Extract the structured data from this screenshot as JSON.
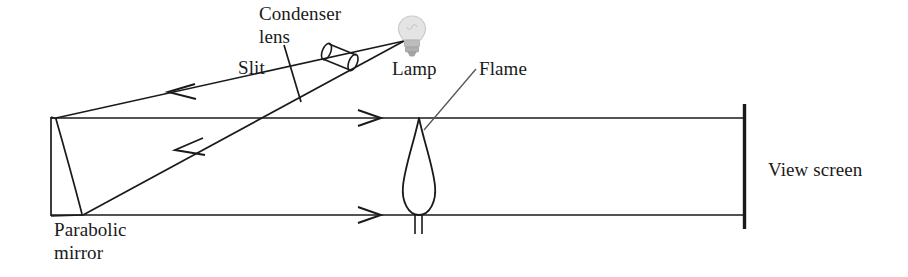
{
  "figure": {
    "type": "optics-ray-diagram",
    "background_color": "#ffffff",
    "ink_color": "#1a1a1a",
    "width": 908,
    "height": 277
  },
  "labels": {
    "condenser_lens_line1": "Condenser",
    "condenser_lens_line2": "lens",
    "slit": "Slit",
    "lamp": "Lamp",
    "flame": "Flame",
    "view_screen": "View screen",
    "parabolic_mirror_line1": "Parabolic",
    "parabolic_mirror_line2": "mirror"
  },
  "components": {
    "lamp": {
      "name": "lamp-bulb",
      "shape": "incandescent-bulb",
      "center_x": 412,
      "center_y": 34,
      "glass_color": "#e2e2e2",
      "base_color": "#b4b4b4"
    },
    "condenser_lens": {
      "name": "condenser-lens",
      "shape": "cylinder-in-perspective",
      "center_x": 344,
      "center_y": 57,
      "tilt_deg": -22
    },
    "slit": {
      "name": "slit",
      "shape": "short-diagonal-line",
      "x1": 286,
      "y1": 46,
      "x2": 300,
      "y2": 101
    },
    "parabolic_mirror": {
      "name": "parabolic-mirror",
      "shape": "parabolic-arc-with-back-plate",
      "back_x": 51,
      "top_y": 118,
      "bottom_y": 215,
      "arc_apex_x": 62
    },
    "flame": {
      "name": "flame",
      "shape": "teardrop",
      "apex_x": 419,
      "apex_y": 118,
      "base_y": 215,
      "half_width": 17,
      "wick_bottom_y": 233
    },
    "view_screen": {
      "name": "view-screen",
      "shape": "vertical-bar",
      "x": 744,
      "top_y": 105,
      "bottom_y": 229
    }
  },
  "rays": {
    "upper_incoming": {
      "name": "lamp-to-mirror-upper-ray",
      "from": [
        405,
        40
      ],
      "to": [
        55,
        118
      ],
      "arrow_at": [
        175,
        92
      ],
      "direction": "left"
    },
    "lower_incoming": {
      "name": "lamp-to-mirror-lower-ray",
      "from": [
        405,
        40
      ],
      "to": [
        82,
        215
      ],
      "arrow_at": [
        183,
        149
      ],
      "direction": "down-left"
    },
    "upper_collimated": {
      "name": "collimated-beam-upper",
      "from": [
        55,
        118
      ],
      "to": [
        744,
        118
      ],
      "arrow_at": [
        368,
        118
      ],
      "direction": "right"
    },
    "lower_collimated": {
      "name": "collimated-beam-lower",
      "from": [
        82,
        215
      ],
      "to": [
        744,
        215
      ],
      "arrow_at": [
        368,
        215
      ],
      "direction": "right"
    }
  },
  "leaders": {
    "flame_leader": {
      "name": "flame-leader-line",
      "from": [
        475,
        70
      ],
      "to": [
        424,
        129
      ]
    },
    "slit_leader": {
      "name": "slit-pointer",
      "from": [
        283,
        52
      ],
      "to": [
        298,
        96
      ]
    }
  }
}
